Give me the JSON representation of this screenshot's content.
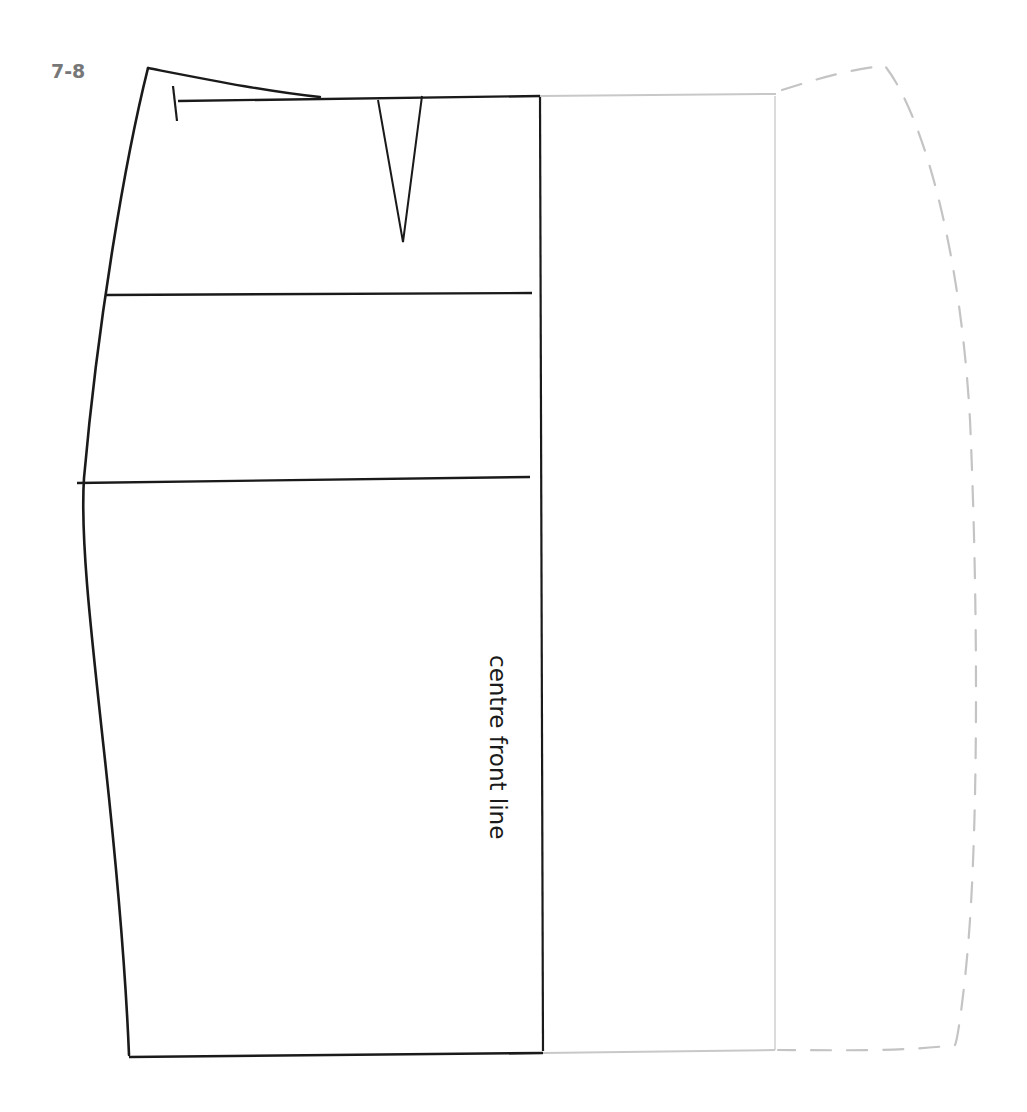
{
  "figure": {
    "label": "7-8",
    "type": "skirt front pattern block"
  },
  "annotations": {
    "centre_front_line": "centre front line"
  },
  "colors": {
    "ink": "#1a1a1a",
    "ghost": "#c8c8c8",
    "figure_label": "#777777",
    "background": "#ffffff"
  },
  "lines": {
    "solid_outline": "side seam, waistline, hip and abdomen lines, hem, centre front",
    "ghost_outline": "mirrored half shown in light grey",
    "dashed_curve": "extension curve shown dashed in light grey"
  }
}
